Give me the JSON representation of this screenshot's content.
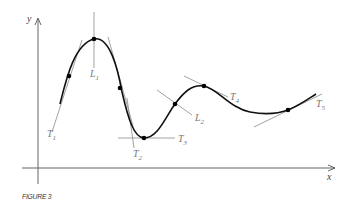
{
  "figure": {
    "caption": "FIGURE 3",
    "axes": {
      "x_label": "x",
      "y_label": "y"
    },
    "labels": {
      "T1": {
        "main": "T",
        "sub": "1"
      },
      "T2": {
        "main": "T",
        "sub": "2"
      },
      "T3": {
        "main": "T",
        "sub": "3"
      },
      "T4": {
        "main": "T",
        "sub": "4"
      },
      "T5": {
        "main": "T",
        "sub": "5"
      },
      "L1": {
        "main": "L",
        "sub": "1"
      },
      "L2": {
        "main": "L",
        "sub": "2"
      }
    },
    "colors": {
      "curve": "#111111",
      "tangent": "#888888",
      "axis": "#444444",
      "point": "#000000"
    }
  }
}
